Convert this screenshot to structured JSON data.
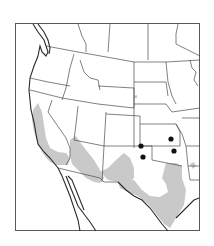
{
  "map": {
    "title": "",
    "region": "Western United States and northern Mexico",
    "legend": [],
    "colors": {
      "range_fill": "#c9c9c9",
      "boundary": "#4a4a4a",
      "coastline": "#2a2a2a",
      "record_dot": "#111111",
      "background": "#ffffff"
    },
    "shaded_range": {
      "description": "Grey shaded distribution area across California, southern Arizona, southern New Mexico, and central/west Texas"
    },
    "record_points": [
      {
        "id": 1,
        "x": 141,
        "y": 146,
        "location": "NE New Mexico / Colorado-Oklahoma corner"
      },
      {
        "id": 2,
        "x": 143,
        "y": 157,
        "location": "Texas panhandle"
      },
      {
        "id": 3,
        "x": 171,
        "y": 139,
        "location": "Kansas"
      },
      {
        "id": 4,
        "x": 174,
        "y": 151,
        "location": "Oklahoma"
      }
    ]
  }
}
